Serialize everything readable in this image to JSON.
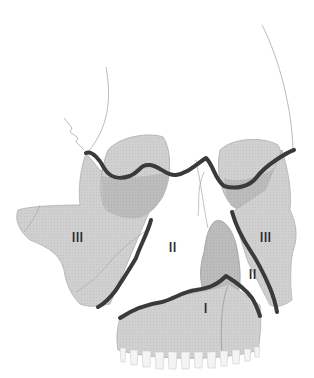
{
  "figure": {
    "labels": [
      {
        "id": "left-III",
        "text": "III",
        "x": 72,
        "y": 229
      },
      {
        "id": "center-II",
        "text": "II",
        "x": 169,
        "y": 239
      },
      {
        "id": "right-III",
        "text": "III",
        "x": 260,
        "y": 229
      },
      {
        "id": "right-II",
        "text": "II",
        "x": 249,
        "y": 266
      },
      {
        "id": "center-I",
        "text": "I",
        "x": 204,
        "y": 300
      }
    ]
  },
  "colors": {
    "background": "#ffffff",
    "bone_fill": "#cfcfcf",
    "orbit_fill": "#bdbdbd",
    "dark_region": "#a9a9a9",
    "fracture_line": "#3a3a3a",
    "outline": "#9a9a9a",
    "teeth": "#f4f4f4"
  }
}
